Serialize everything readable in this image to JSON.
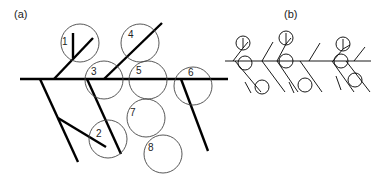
{
  "figure": {
    "panel_a": {
      "label": "(a)",
      "circle_labels": [
        "1",
        "2",
        "3",
        "4",
        "5",
        "6",
        "7",
        "8"
      ]
    },
    "panel_b": {
      "label": "(b)"
    }
  },
  "colors": {
    "stroke": "#000000",
    "circle": "#444444",
    "text": "#222222",
    "background": "#ffffff"
  }
}
